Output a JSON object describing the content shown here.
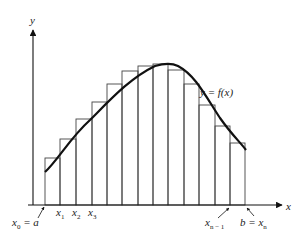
{
  "diagram": {
    "type": "riemann-upper-sum",
    "axes": {
      "x_label": "x",
      "y_label": "y"
    },
    "curve_label": "y = f(x)",
    "ticks": {
      "x0": "x",
      "x0_sub": "0",
      "x0_eq": " = a",
      "x1": "x",
      "x1_sub": "1",
      "x2": "x",
      "x2_sub": "2",
      "x3": "x",
      "x3_sub": "3",
      "xn1": "x",
      "xn1_sub": "n − 1",
      "b_eq": "b = x",
      "xn_sub": "n"
    },
    "rectangles": [
      {
        "x0": 45,
        "x1": 60,
        "top": 158
      },
      {
        "x0": 60,
        "x1": 76,
        "top": 139
      },
      {
        "x0": 76,
        "x1": 92,
        "top": 119
      },
      {
        "x0": 92,
        "x1": 107,
        "top": 102
      },
      {
        "x0": 107,
        "x1": 122,
        "top": 84
      },
      {
        "x0": 122,
        "x1": 138,
        "top": 71
      },
      {
        "x0": 138,
        "x1": 153,
        "top": 66
      },
      {
        "x0": 153,
        "x1": 168,
        "top": 64
      },
      {
        "x0": 168,
        "x1": 184,
        "top": 70
      },
      {
        "x0": 184,
        "x1": 199,
        "top": 84
      },
      {
        "x0": 199,
        "x1": 215,
        "top": 105
      },
      {
        "x0": 215,
        "x1": 230,
        "top": 126
      },
      {
        "x0": 230,
        "x1": 245,
        "top": 143
      }
    ],
    "colors": {
      "stroke": "#333333",
      "curve": "#111111",
      "background": "#ffffff"
    }
  }
}
